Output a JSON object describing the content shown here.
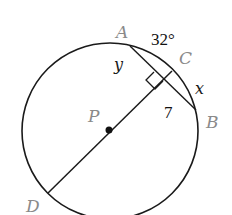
{
  "diagram": {
    "type": "circle-geometry",
    "circle": {
      "center_label": "P",
      "stroke": "#1a1a1a"
    },
    "points": {
      "A": "A",
      "B": "B",
      "C": "C",
      "D": "D",
      "P": "P"
    },
    "labels": {
      "arc_AC": "32°",
      "segment_y": "y",
      "segment_x": "x",
      "segment_7": "7"
    },
    "segments": [
      "AB (chord)",
      "DC (diameter through P, perpendicular to AB)"
    ],
    "right_angle_marker": true,
    "colors": {
      "point_label": "#8a8a8a",
      "line": "#1a1a1a"
    }
  }
}
